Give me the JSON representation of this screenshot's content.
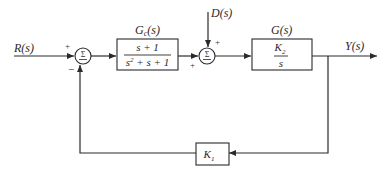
{
  "diagram": {
    "type": "control-system-block-diagram",
    "signals": {
      "input": "R(s)",
      "disturbance": "D(s)",
      "output": "Y(s)"
    },
    "summing_junctions": [
      {
        "id": "sum1",
        "symbol": "Σ",
        "top_sign": "+",
        "bottom_sign": "−",
        "inputs": [
          "R(s)",
          "feedback"
        ]
      },
      {
        "id": "sum2",
        "symbol": "Σ",
        "top_sign": "+",
        "left_sign": "+",
        "inputs": [
          "Gc output",
          "D(s)"
        ]
      }
    ],
    "blocks": {
      "controller": {
        "label": "Gc(s)",
        "label_main": "G",
        "label_sub": "c",
        "label_arg": "(s)",
        "numerator": "s + 1",
        "denominator_base": "s",
        "denominator_exp": "2",
        "denominator_rest": " + s + 1"
      },
      "plant": {
        "label": "G(s)",
        "numerator_main": "K",
        "numerator_sub": "2",
        "denominator": "s"
      },
      "feedback": {
        "label_main": "K",
        "label_sub": "1"
      }
    },
    "colors": {
      "line": "#2a2a2a",
      "background": "#ffffff"
    }
  }
}
